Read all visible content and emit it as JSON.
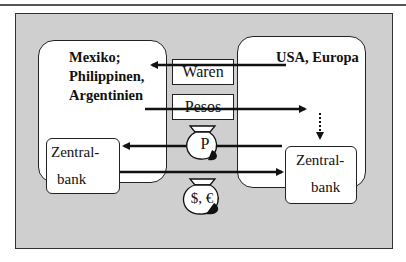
{
  "diagram": {
    "left_region": {
      "title_lines": [
        "Mexiko;",
        "Philippinen,",
        "Argentinien"
      ],
      "central_bank": [
        "Zentral-",
        "bank"
      ]
    },
    "right_region": {
      "title": "USA, Europa",
      "central_bank": [
        "Zentral-",
        "bank"
      ]
    },
    "flows": {
      "goods_label": "Waren",
      "currency_label": "Pesos",
      "peso_bag_symbol": "P",
      "dollar_euro_bag_symbol": "$, €"
    },
    "colors": {
      "frame_background": "#cfcfcf",
      "region_background": "#ffffff",
      "stroke": "#111111"
    }
  }
}
